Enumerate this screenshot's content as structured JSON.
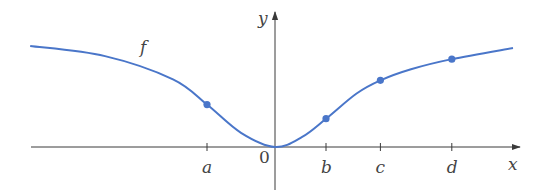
{
  "figure": {
    "function_label": "f",
    "x_axis_label": "x",
    "y_axis_label": "y",
    "origin_label": "0",
    "tick_labels": [
      "a",
      "b",
      "c",
      "d"
    ],
    "curve_color": "#4a76c9",
    "axis_color": "#3a3a3a"
  },
  "chart_data": {
    "type": "line",
    "title": "",
    "xlabel": "x",
    "ylabel": "y",
    "function": "f",
    "x_ticks": [
      {
        "label": "a",
        "x": -1.0
      },
      {
        "label": "0",
        "x": 0.0
      },
      {
        "label": "b",
        "x": 0.75
      },
      {
        "label": "c",
        "x": 1.55
      },
      {
        "label": "d",
        "x": 2.6
      }
    ],
    "marked_points": [
      {
        "label": "a",
        "x": -1.0,
        "y": 0.42
      },
      {
        "label": "b",
        "x": 0.75,
        "y": 0.28
      },
      {
        "label": "c",
        "x": 1.55,
        "y": 0.66
      },
      {
        "label": "d",
        "x": 2.6,
        "y": 0.87
      }
    ],
    "curve_samples": [
      {
        "x": -3.6,
        "y": 1.0
      },
      {
        "x": -2.5,
        "y": 0.9
      },
      {
        "x": -1.5,
        "y": 0.67
      },
      {
        "x": -1.0,
        "y": 0.42
      },
      {
        "x": -0.5,
        "y": 0.14
      },
      {
        "x": 0.0,
        "y": 0.0
      },
      {
        "x": 0.4,
        "y": 0.1
      },
      {
        "x": 0.75,
        "y": 0.28
      },
      {
        "x": 1.2,
        "y": 0.53
      },
      {
        "x": 1.55,
        "y": 0.66
      },
      {
        "x": 2.0,
        "y": 0.77
      },
      {
        "x": 2.6,
        "y": 0.87
      },
      {
        "x": 3.5,
        "y": 0.98
      }
    ],
    "xlim": [
      -3.6,
      3.6
    ],
    "ylim": [
      -0.4,
      1.3
    ],
    "grid": false,
    "legend": "none"
  }
}
